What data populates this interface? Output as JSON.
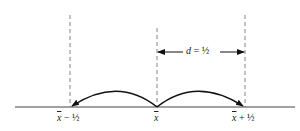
{
  "diagram": {
    "distance_label": {
      "var": "d",
      "eq": " = ",
      "value": "½"
    },
    "points": [
      {
        "id": "left",
        "sym": "x",
        "suffix": " − ½"
      },
      {
        "id": "center",
        "sym": "x",
        "suffix": ""
      },
      {
        "id": "right",
        "sym": "x",
        "suffix": " + ½"
      }
    ],
    "colors": {
      "line": "#333333",
      "dashed": "#666666",
      "arrow": "#111111"
    }
  }
}
